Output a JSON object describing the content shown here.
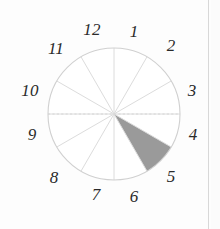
{
  "figure": {
    "kind": "clock-face-sector-diagram",
    "background_color": "#fdfdfd",
    "circle": {
      "center_x": 114,
      "center_y": 114,
      "radius": 66,
      "stroke_color": "#d0d0d0",
      "stroke_width": 1.1,
      "fill_color": "#ffffff"
    },
    "spokes": {
      "count": 12,
      "stroke_color": "#dcdcdc",
      "stroke_width": 1
    },
    "horizontal_axis": {
      "stroke_color": "#d6d6d6",
      "stroke_width": 1,
      "dashed": true
    },
    "shaded_sector": {
      "from_hour": "4",
      "to_hour": "5",
      "start_angle_deg": 120,
      "end_angle_deg": 150,
      "fill_color": "#9a9a9a",
      "label": "shaded-sector-4-to-5"
    },
    "hour_labels": [
      {
        "value": "12",
        "hour": 12,
        "x": 92,
        "y": 29,
        "size": 17
      },
      {
        "value": "1",
        "hour": 1,
        "x": 134,
        "y": 31,
        "size": 17
      },
      {
        "value": "2",
        "hour": 2,
        "x": 171,
        "y": 45,
        "size": 17
      },
      {
        "value": "3",
        "hour": 3,
        "x": 192,
        "y": 90,
        "size": 17
      },
      {
        "value": "4",
        "hour": 4,
        "x": 193,
        "y": 134,
        "size": 17
      },
      {
        "value": "5",
        "hour": 5,
        "x": 171,
        "y": 176,
        "size": 17
      },
      {
        "value": "6",
        "hour": 6,
        "x": 134,
        "y": 196,
        "size": 17
      },
      {
        "value": "7",
        "hour": 7,
        "x": 96,
        "y": 194,
        "size": 17
      },
      {
        "value": "8",
        "hour": 8,
        "x": 54,
        "y": 177,
        "size": 17
      },
      {
        "value": "9",
        "hour": 9,
        "x": 32,
        "y": 134,
        "size": 17
      },
      {
        "value": "10",
        "hour": 10,
        "x": 30,
        "y": 90,
        "size": 17
      },
      {
        "value": "11",
        "hour": 11,
        "x": 56,
        "y": 48,
        "size": 17
      }
    ],
    "page_edge": {
      "visible": true,
      "color": "#d8d8d8"
    }
  }
}
